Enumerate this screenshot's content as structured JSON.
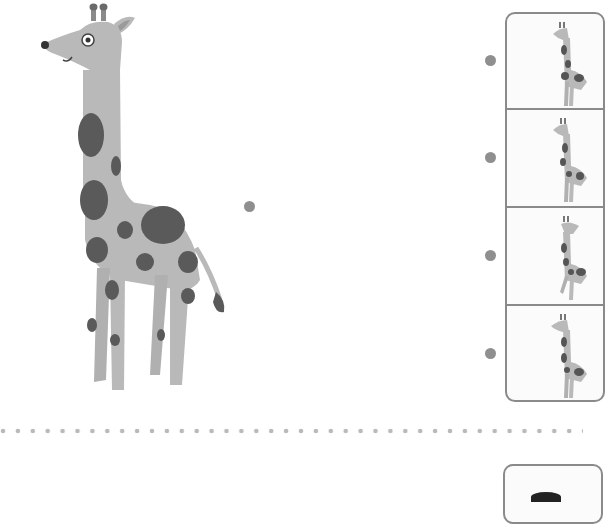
{
  "worksheet": {
    "type": "matching-activity",
    "main_image": {
      "subject": "giraffe",
      "description": "large spotted giraffe illustration"
    },
    "source_dot": {
      "color": "#8f8f8f"
    },
    "options": [
      {
        "index": 1,
        "subject": "giraffe",
        "dot_color": "#8f8f8f"
      },
      {
        "index": 2,
        "subject": "giraffe",
        "dot_color": "#8f8f8f"
      },
      {
        "index": 3,
        "subject": "giraffe",
        "dot_color": "#8f8f8f"
      },
      {
        "index": 4,
        "subject": "giraffe",
        "dot_color": "#8f8f8f"
      }
    ],
    "divider": {
      "style": "dotted",
      "color": "#b9b9b9"
    },
    "colors": {
      "giraffe_body": "#b9b9b9",
      "giraffe_spots": "#5a5a5a",
      "panel_border": "#8a8a8a"
    }
  }
}
